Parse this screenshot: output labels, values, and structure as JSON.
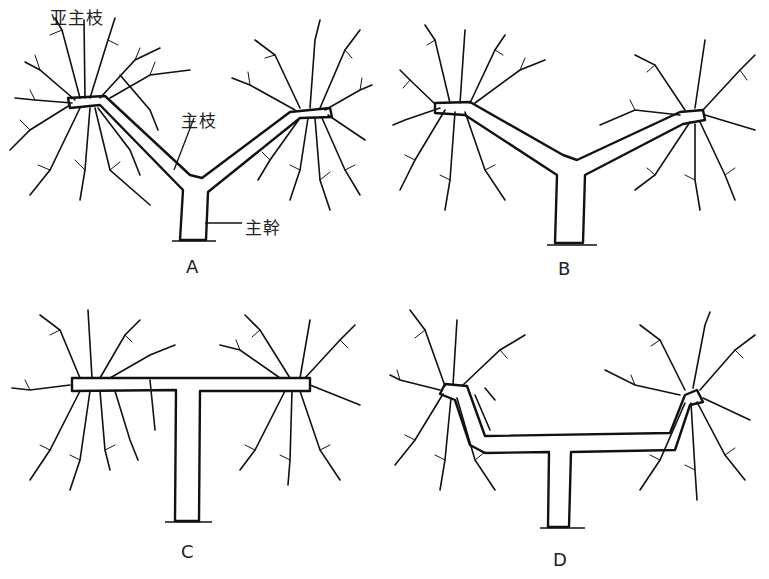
{
  "figure": {
    "panels": [
      {
        "id": "A",
        "label": "A",
        "shape": "Y-shaped, steep main branches"
      },
      {
        "id": "B",
        "label": "B",
        "shape": "Y-shaped, flatter main branches"
      },
      {
        "id": "C",
        "label": "C",
        "shape": "T-shaped, horizontal main branches"
      },
      {
        "id": "D",
        "label": "D",
        "shape": "U/T-shaped, horizontal arms with upturned ends"
      }
    ],
    "annotations": {
      "sub_main_branch": "亚主枝",
      "main_branch": "主枝",
      "trunk": "主幹"
    }
  }
}
